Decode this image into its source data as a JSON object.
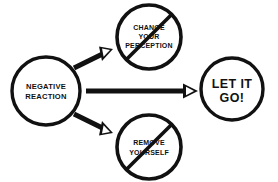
{
  "diagram": {
    "background_color": "#ffffff",
    "ink_color": "#111111",
    "nodes": [
      {
        "id": "negative-reaction",
        "label_lines": [
          "NEGATIVE",
          "REACTION"
        ],
        "line1": "NEGATIVE",
        "line2": "REACTION",
        "shape": "circle",
        "crossed_out": false,
        "cx": 46,
        "cy": 91,
        "r": 34
      },
      {
        "id": "change-your-perception",
        "label_lines": [
          "CHANGE",
          "YOUR",
          "PERCEPTION"
        ],
        "line1": "CHANGE",
        "line2": "YOUR",
        "line3": "PERCEPTION",
        "shape": "circle",
        "crossed_out": true,
        "cx": 149,
        "cy": 37,
        "r": 32
      },
      {
        "id": "remove-yourself",
        "label_lines": [
          "REMOVE",
          "YOURSELF"
        ],
        "line1": "REMOVE",
        "line2": "YOURSELF",
        "shape": "circle",
        "crossed_out": true,
        "cx": 149,
        "cy": 147,
        "r": 32
      },
      {
        "id": "let-it-go",
        "label_lines": [
          "LET IT",
          "GO!"
        ],
        "line1": "LET IT",
        "line2": "GO!",
        "shape": "circle",
        "crossed_out": false,
        "cx": 232,
        "cy": 89,
        "r": 31
      }
    ],
    "arrows": [
      {
        "id": "arrow-to-change-perception",
        "from": "negative-reaction",
        "to": "change-your-perception",
        "direction": "up-right"
      },
      {
        "id": "arrow-to-let-it-go",
        "from": "negative-reaction",
        "to": "let-it-go",
        "direction": "right"
      },
      {
        "id": "arrow-to-remove-yourself",
        "from": "negative-reaction",
        "to": "remove-yourself",
        "direction": "down-right"
      }
    ]
  }
}
